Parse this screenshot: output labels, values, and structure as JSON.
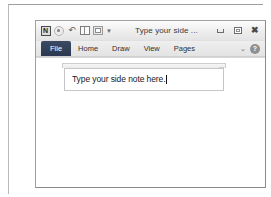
{
  "window": {
    "title": "Type your side ...",
    "app_logo_letter": "N",
    "quick_access": [
      {
        "name": "app-logo-icon",
        "label": "N"
      },
      {
        "name": "back-circle-icon",
        "label": ""
      },
      {
        "name": "undo-icon",
        "label": "↶"
      },
      {
        "name": "split-panel-icon",
        "label": ""
      },
      {
        "name": "dock-panel-icon",
        "label": ""
      },
      {
        "name": "qat-dropdown-icon",
        "label": "▾"
      }
    ],
    "controls": {
      "minimize": "–",
      "restore": "❐",
      "close": "✕"
    }
  },
  "ribbon": {
    "tabs": [
      {
        "label": "File",
        "active": true
      },
      {
        "label": "Home",
        "active": false
      },
      {
        "label": "Draw",
        "active": false
      },
      {
        "label": "View",
        "active": false
      },
      {
        "label": "Pages",
        "active": false
      }
    ],
    "collapse_chevron": "⌄",
    "help_label": "?"
  },
  "note": {
    "text": "Type your side note here.",
    "placeholder": "Type your side note here.",
    "resize_handle": "⋯"
  },
  "colors": {
    "active_tab": "#2b3850",
    "title_bar": "#f0f0f0",
    "canvas": "#ffffff",
    "frame_border": "#a0a0a0"
  }
}
